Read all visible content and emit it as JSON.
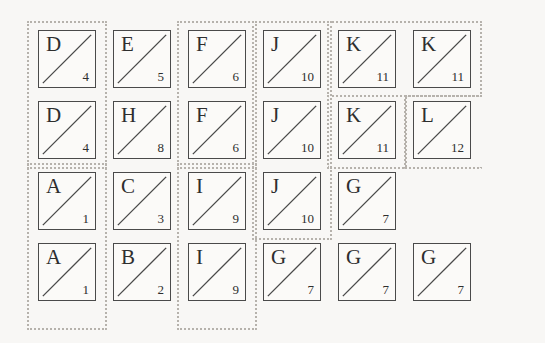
{
  "canvas": {
    "width": 545,
    "height": 343,
    "background": "#f8f7f5"
  },
  "style": {
    "tile_border_color": "#4a4a4a",
    "tile_fill_color": "#fbfaf8",
    "diagonal_color": "#4a4a4a",
    "group_border_color": "#b6b2ac",
    "text_color": "#2e2e2e",
    "tile_size": 58,
    "col_pitch": 75,
    "row_pitch": 71,
    "origin_x": 38,
    "origin_y": 30
  },
  "grid": {
    "columns": 6,
    "rows": 4
  },
  "tiles": [
    {
      "id": "r1c1",
      "row": 0,
      "col": 0,
      "letter": "D",
      "number": "4"
    },
    {
      "id": "r1c2",
      "row": 0,
      "col": 1,
      "letter": "E",
      "number": "5"
    },
    {
      "id": "r1c3",
      "row": 0,
      "col": 2,
      "letter": "F",
      "number": "6"
    },
    {
      "id": "r1c4",
      "row": 0,
      "col": 3,
      "letter": "J",
      "number": "10"
    },
    {
      "id": "r1c5",
      "row": 0,
      "col": 4,
      "letter": "K",
      "number": "11"
    },
    {
      "id": "r1c6",
      "row": 0,
      "col": 5,
      "letter": "K",
      "number": "11"
    },
    {
      "id": "r2c1",
      "row": 1,
      "col": 0,
      "letter": "D",
      "number": "4"
    },
    {
      "id": "r2c2",
      "row": 1,
      "col": 1,
      "letter": "H",
      "number": "8"
    },
    {
      "id": "r2c3",
      "row": 1,
      "col": 2,
      "letter": "F",
      "number": "6"
    },
    {
      "id": "r2c4",
      "row": 1,
      "col": 3,
      "letter": "J",
      "number": "10"
    },
    {
      "id": "r2c5",
      "row": 1,
      "col": 4,
      "letter": "K",
      "number": "11"
    },
    {
      "id": "r2c6",
      "row": 1,
      "col": 5,
      "letter": "L",
      "number": "12"
    },
    {
      "id": "r3c1",
      "row": 2,
      "col": 0,
      "letter": "A",
      "number": "1"
    },
    {
      "id": "r3c2",
      "row": 2,
      "col": 1,
      "letter": "C",
      "number": "3"
    },
    {
      "id": "r3c3",
      "row": 2,
      "col": 2,
      "letter": "I",
      "number": "9"
    },
    {
      "id": "r3c4",
      "row": 2,
      "col": 3,
      "letter": "J",
      "number": "10"
    },
    {
      "id": "r3c5",
      "row": 2,
      "col": 4,
      "letter": "G",
      "number": "7"
    },
    {
      "id": "r4c1",
      "row": 3,
      "col": 0,
      "letter": "A",
      "number": "1"
    },
    {
      "id": "r4c2",
      "row": 3,
      "col": 1,
      "letter": "B",
      "number": "2"
    },
    {
      "id": "r4c3",
      "row": 3,
      "col": 2,
      "letter": "I",
      "number": "9"
    },
    {
      "id": "r4c4",
      "row": 3,
      "col": 3,
      "letter": "G",
      "number": "7"
    },
    {
      "id": "r4c5",
      "row": 3,
      "col": 4,
      "letter": "G",
      "number": "7"
    },
    {
      "id": "r4c6",
      "row": 3,
      "col": 5,
      "letter": "G",
      "number": "7"
    }
  ],
  "groups": [
    {
      "id": "group-d",
      "label": "D",
      "x": 27,
      "y": 21,
      "w": 80,
      "h": 148,
      "edges": "all"
    },
    {
      "id": "group-a",
      "label": "A",
      "x": 27,
      "y": 163,
      "w": 80,
      "h": 167,
      "edges": "all"
    },
    {
      "id": "group-f",
      "label": "F",
      "x": 177,
      "y": 21,
      "w": 80,
      "h": 148,
      "edges": "all"
    },
    {
      "id": "group-i",
      "label": "I",
      "x": 177,
      "y": 163,
      "w": 80,
      "h": 167,
      "edges": "all"
    },
    {
      "id": "group-j",
      "label": "J",
      "x": 252,
      "y": 21,
      "w": 80,
      "h": 219,
      "edges": "all"
    },
    {
      "id": "group-k-top",
      "label": "K",
      "x": 327,
      "y": 21,
      "w": 155,
      "h": 76,
      "edges": "all"
    },
    {
      "id": "group-k-bottom",
      "label": "K",
      "x": 327,
      "y": 95,
      "w": 80,
      "h": 74,
      "edges": "no-top"
    },
    {
      "id": "group-l",
      "label": "L",
      "x": 404,
      "y": 95,
      "w": 78,
      "h": 74,
      "edges": "no-right"
    }
  ]
}
